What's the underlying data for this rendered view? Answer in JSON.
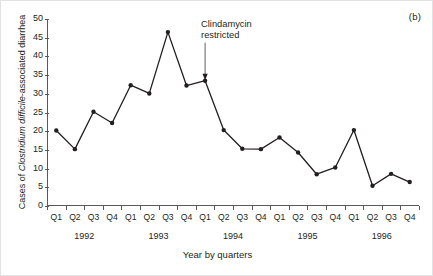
{
  "figure": {
    "panel_label": "(b)",
    "background_color": "#ffffff",
    "line_color": "#231f20",
    "marker_color": "#231f20",
    "axis_color": "#58595b"
  },
  "axes": {
    "ylabel_prefix": "Cases of ",
    "ylabel_italic": "Clostridium difficile",
    "ylabel_suffix": "-associated diarrhea",
    "ylabel_full": "Cases of Clostridium difficile-associated diarrhea",
    "xlabel": "Year by quarters",
    "yticks": [
      0,
      5,
      10,
      15,
      20,
      25,
      30,
      35,
      40,
      45,
      50
    ],
    "ylim": [
      0,
      50
    ],
    "quarter_labels": [
      "Q1",
      "Q2",
      "Q3",
      "Q4",
      "Q1",
      "Q2",
      "Q3",
      "Q4",
      "Q1",
      "Q2",
      "Q3",
      "Q4",
      "Q1",
      "Q2",
      "Q3",
      "Q4",
      "Q1",
      "Q2",
      "Q3",
      "Q4"
    ],
    "year_labels": [
      "1992",
      "1993",
      "1994",
      "1995",
      "1996"
    ]
  },
  "annotation": {
    "line1": "Clindamycin",
    "line2": "restricted",
    "text": "Clindamycin restricted",
    "points_to_index": 8,
    "points_to_category": "Q1 1994"
  },
  "chart_data": {
    "type": "line",
    "title": "",
    "subtitle": "",
    "xlabel": "Year by quarters",
    "ylabel": "Cases of Clostridium difficile-associated diarrhea",
    "ylim": [
      0,
      50
    ],
    "ytick_step": 5,
    "grid": false,
    "legend": "none",
    "marker": "filled-circle",
    "categories": [
      "Q1 1992",
      "Q2 1992",
      "Q3 1992",
      "Q4 1992",
      "Q1 1993",
      "Q2 1993",
      "Q3 1993",
      "Q4 1993",
      "Q1 1994",
      "Q2 1994",
      "Q3 1994",
      "Q4 1994",
      "Q1 1995",
      "Q2 1995",
      "Q3 1995",
      "Q4 1995",
      "Q1 1996",
      "Q2 1996",
      "Q3 1996",
      "Q4 1996"
    ],
    "values": [
      20.2,
      15.2,
      25.2,
      22.2,
      32.3,
      30.1,
      46.5,
      32.2,
      33.5,
      20.3,
      15.3,
      15.2,
      18.3,
      14.3,
      8.5,
      10.3,
      20.3,
      5.4,
      8.6,
      6.4
    ],
    "annotations": [
      {
        "text": "Clindamycin restricted",
        "at_category": "Q1 1994",
        "at_value": 33.5,
        "style": "arrow-down"
      }
    ]
  }
}
